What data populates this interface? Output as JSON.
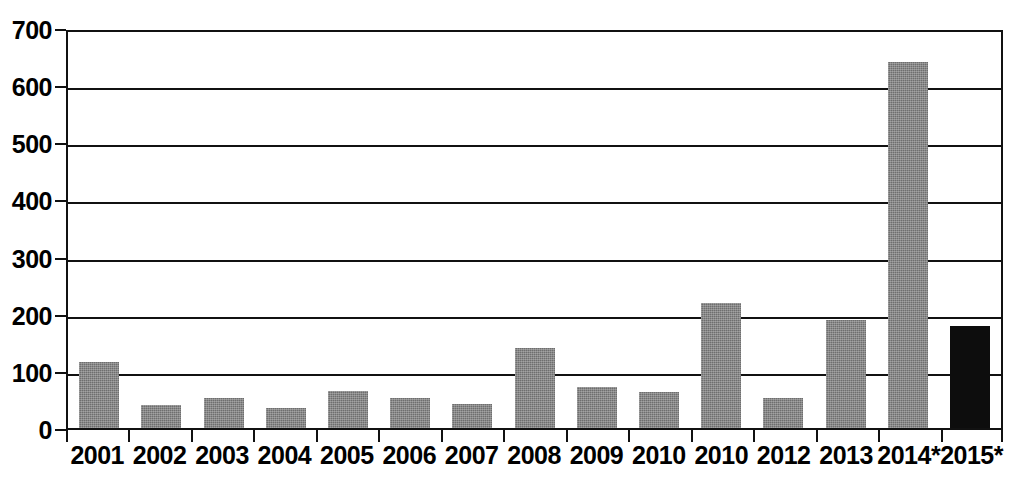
{
  "chart_data": {
    "type": "bar",
    "title": "",
    "subtitle": "",
    "xlabel": "",
    "ylabel": "",
    "ylim": [
      0,
      700
    ],
    "ytick_step": 100,
    "yticks": [
      0,
      100,
      200,
      300,
      400,
      500,
      600,
      700
    ],
    "ytick_labels": [
      "0",
      "100",
      "200",
      "300",
      "400",
      "500",
      "600",
      "700"
    ],
    "grid": true,
    "legend": false,
    "legend_position": "none",
    "annotations": [],
    "categories": [
      "2001",
      "2002",
      "2003",
      "2004",
      "2005",
      "2006",
      "2007",
      "2008",
      "2009",
      "2010",
      "2010",
      "2012",
      "2013",
      "2014*",
      "2015*"
    ],
    "values": [
      115,
      40,
      52,
      35,
      65,
      52,
      42,
      140,
      72,
      63,
      218,
      52,
      189,
      640,
      178
    ],
    "bar_colors": [
      "#6e6e6e",
      "#6e6e6e",
      "#6e6e6e",
      "#6e6e6e",
      "#6e6e6e",
      "#6e6e6e",
      "#6e6e6e",
      "#6e6e6e",
      "#6e6e6e",
      "#6e6e6e",
      "#6e6e6e",
      "#6e6e6e",
      "#6e6e6e",
      "#6e6e6e",
      "#0d0d0d"
    ],
    "highlight_index": 14,
    "colors": {
      "bar_gray": "#6e6e6e",
      "bar_black": "#0d0d0d",
      "axis": "#111111",
      "grid": "#111111",
      "background": "#ffffff",
      "text": "#000000"
    }
  }
}
